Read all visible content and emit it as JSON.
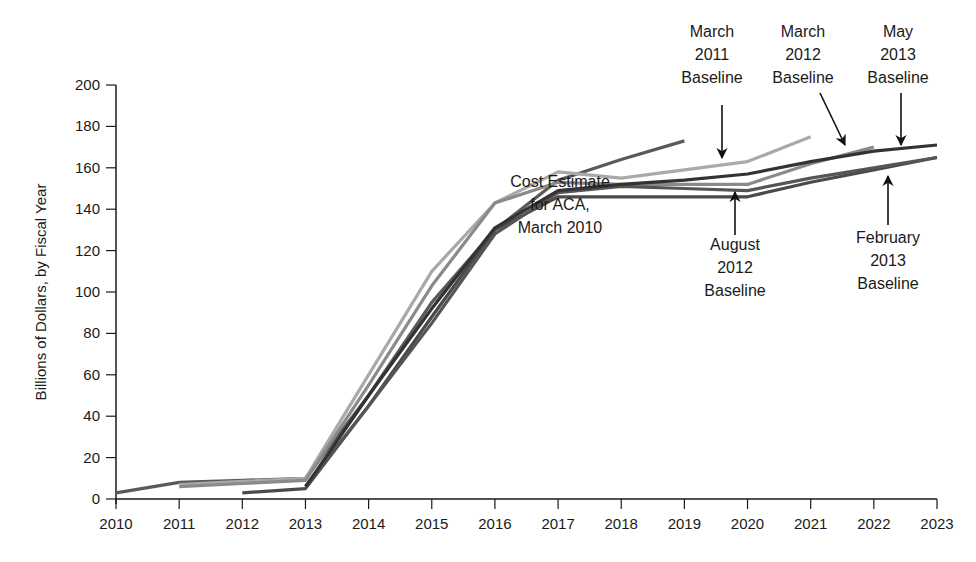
{
  "chart_data": {
    "type": "line",
    "title": "",
    "xlabel": "",
    "ylabel": "Billions of Dollars, by Fiscal Year",
    "xlim": [
      2010,
      2023
    ],
    "ylim": [
      0,
      200
    ],
    "x_ticks": [
      "2010",
      "2011",
      "2012",
      "2013",
      "2014",
      "2015",
      "2016",
      "2017",
      "2018",
      "2019",
      "2020",
      "2021",
      "2022",
      "2023"
    ],
    "y_ticks": [
      "0",
      "20",
      "40",
      "60",
      "80",
      "100",
      "120",
      "140",
      "160",
      "180",
      "200"
    ],
    "grid": false,
    "legend": "none (direct annotations with arrows)",
    "series": [
      {
        "name": "Cost Estimate for ACA, March 2010",
        "color": "#5a5a5a",
        "x": [
          2010,
          2011,
          2012,
          2013,
          2014,
          2015,
          2016,
          2017,
          2018,
          2019
        ],
        "values": [
          3,
          8,
          9,
          10,
          50,
          95,
          130,
          154,
          164,
          173
        ]
      },
      {
        "name": "March 2011 Baseline",
        "color": "#a9a9a9",
        "x": [
          2011,
          2012,
          2013,
          2014,
          2015,
          2016,
          2017,
          2018,
          2019,
          2020,
          2021
        ],
        "values": [
          7,
          8.5,
          10,
          60,
          110,
          143,
          158,
          155,
          159,
          163,
          175
        ]
      },
      {
        "name": "March 2012 Baseline",
        "color": "#8a8a8a",
        "x": [
          2011,
          2012,
          2013,
          2014,
          2015,
          2016,
          2017,
          2018,
          2019,
          2020,
          2021,
          2022
        ],
        "values": [
          6,
          7.5,
          9,
          55,
          103,
          143,
          153,
          152,
          152,
          152,
          162,
          170
        ]
      },
      {
        "name": "August 2012 Baseline",
        "color": "#4a4a4a",
        "x": [
          2012,
          2013,
          2014,
          2015,
          2016,
          2017,
          2018,
          2019,
          2020,
          2021,
          2022,
          2023
        ],
        "values": [
          3,
          5,
          45,
          88,
          130,
          146,
          146,
          146,
          146,
          153,
          159,
          165
        ]
      },
      {
        "name": "February 2013 Baseline",
        "color": "#555555",
        "x": [
          2013,
          2014,
          2015,
          2016,
          2017,
          2018,
          2019,
          2020,
          2021,
          2022,
          2023
        ],
        "values": [
          6,
          45,
          85,
          128,
          148,
          151,
          150,
          149,
          155,
          160,
          165
        ]
      },
      {
        "name": "May 2013 Baseline",
        "color": "#333333",
        "x": [
          2013,
          2014,
          2015,
          2016,
          2017,
          2018,
          2019,
          2020,
          2021,
          2022,
          2023
        ],
        "values": [
          6,
          50,
          92,
          131,
          149,
          152,
          154,
          157,
          163,
          168,
          171
        ]
      }
    ],
    "annotations": [
      {
        "lines": [
          "Cost Estimate",
          "for ACA,",
          "March 2010"
        ]
      },
      {
        "lines": [
          "March",
          "2011",
          "Baseline"
        ]
      },
      {
        "lines": [
          "March",
          "2012",
          "Baseline"
        ]
      },
      {
        "lines": [
          "May",
          "2013",
          "Baseline"
        ]
      },
      {
        "lines": [
          "August",
          "2012",
          "Baseline"
        ]
      },
      {
        "lines": [
          "February",
          "2013",
          "Baseline"
        ]
      }
    ]
  }
}
